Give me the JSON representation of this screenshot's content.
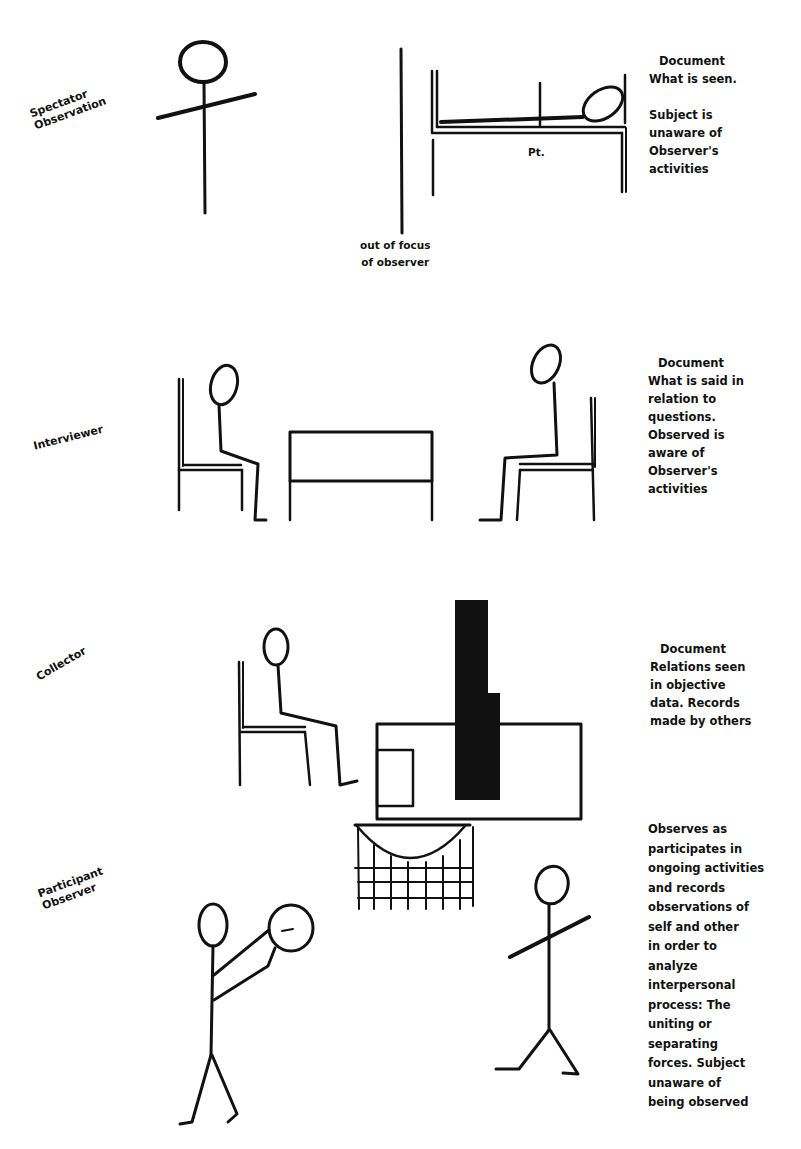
{
  "panels": [
    {
      "id": "spectator",
      "label": "Spectator\nObservation",
      "description_heading": "Document",
      "description_lines": [
        "What is seen.",
        "",
        "Subject is",
        "unaware of",
        "Observer's",
        "activities"
      ],
      "annotations": {
        "patient": "Pt.",
        "out_of_focus": "out of focus\nof observer"
      }
    },
    {
      "id": "interviewer",
      "label": "Interviewer",
      "description_heading": "Document",
      "description_lines": [
        "What is said in",
        "relation to",
        "questions.",
        "Observed is",
        "aware of",
        "Observer's",
        "activities"
      ]
    },
    {
      "id": "collector",
      "label": "Collector",
      "description_heading": "Document",
      "description_lines": [
        "Relations seen",
        "in objective",
        "data. Records",
        "made by others"
      ]
    },
    {
      "id": "participant",
      "label": "Participant\nObserver",
      "description_heading": "",
      "description_lines": [
        "Observes as",
        "participates in",
        "ongoing activities",
        "and records",
        "observations of",
        "self and other",
        "in order to",
        "analyze",
        "interpersonal",
        "process: The",
        "uniting or",
        "separating",
        "forces. Subject",
        "unaware of",
        "being observed"
      ]
    }
  ]
}
